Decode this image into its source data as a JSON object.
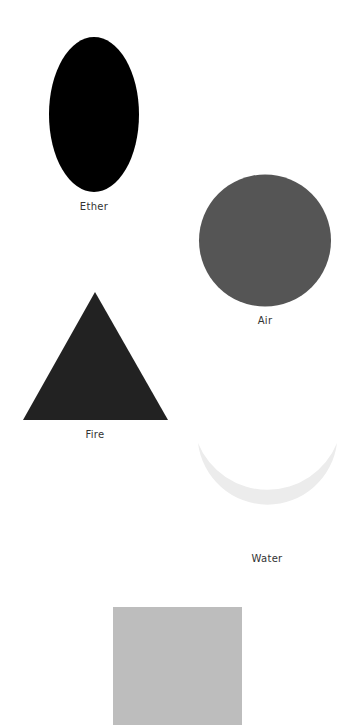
{
  "elements": [
    {
      "name": "Ether",
      "shape": "ellipse",
      "color": "#000000"
    },
    {
      "name": "Air",
      "shape": "circle",
      "color": "#555555"
    },
    {
      "name": "Fire",
      "shape": "triangle",
      "color": "#222222"
    },
    {
      "name": "Water",
      "shape": "crescent",
      "color": "#ececec"
    },
    {
      "name": "Earth",
      "shape": "square",
      "color": "#bdbdbd"
    }
  ],
  "labels": {
    "ether": "Ether",
    "air": "Air",
    "fire": "Fire",
    "water": "Water"
  }
}
